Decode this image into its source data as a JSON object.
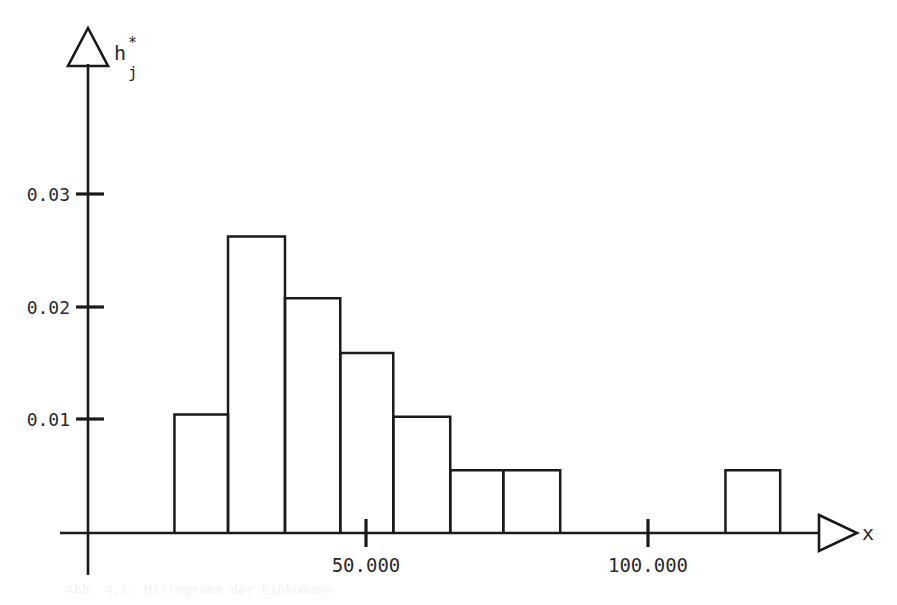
{
  "figure": {
    "background_color": "#ffffff",
    "ink_color": "#1a1a1a",
    "width": 897,
    "height": 605
  },
  "axes": {
    "y_axis_name": "h",
    "y_axis_name_superscript": "*",
    "y_axis_name_subscript": "j",
    "x_axis_name": "x",
    "y_tick_labels": [
      "0.03",
      "0.02",
      "0.01"
    ],
    "x_tick_labels": [
      "50.000",
      "100.000"
    ]
  },
  "caption": {
    "text": "Abb. 4.1: Histogramm der Einkommen"
  },
  "chart_data": {
    "type": "bar",
    "title": "",
    "xlabel": "x",
    "ylabel": "h*_j",
    "xlim": [
      0,
      130
    ],
    "ylim": [
      0,
      0.0325
    ],
    "grid": false,
    "legend": "none",
    "x_ticks": [
      50,
      100
    ],
    "x_tick_labels": [
      "50.000",
      "100.000"
    ],
    "y_ticks": [
      0.01,
      0.02,
      0.03
    ],
    "y_tick_labels": [
      "0.01",
      "0.02",
      "0.03"
    ],
    "note": "Density histogram with unequal class widths; isolated final class separated by a gap.",
    "bins": [
      {
        "label": "bin-1",
        "x_start": 16.0,
        "x_end": 25.5,
        "height": 0.0104
      },
      {
        "label": "bin-2",
        "x_start": 25.5,
        "x_end": 35.6,
        "height": 0.026
      },
      {
        "label": "bin-3",
        "x_start": 35.6,
        "x_end": 45.4,
        "height": 0.0206
      },
      {
        "label": "bin-4",
        "x_start": 45.4,
        "x_end": 54.8,
        "height": 0.0158
      },
      {
        "label": "bin-5",
        "x_start": 54.8,
        "x_end": 64.9,
        "height": 0.0102
      },
      {
        "label": "bin-6",
        "x_start": 64.9,
        "x_end": 74.3,
        "height": 0.0055
      },
      {
        "label": "bin-7",
        "x_start": 74.3,
        "x_end": 84.4,
        "height": 0.0055
      },
      {
        "label": "bin-8",
        "x_start": 113.7,
        "x_end": 123.4,
        "height": 0.0055
      }
    ]
  }
}
